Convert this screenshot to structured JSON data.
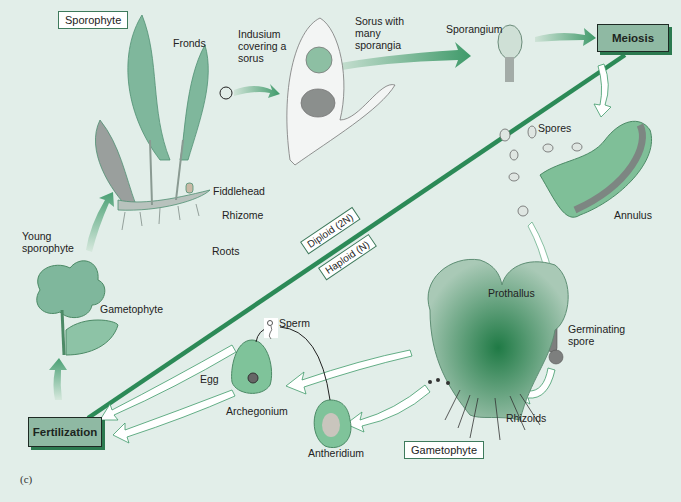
{
  "figure": {
    "panel_label": "(c)",
    "colors": {
      "background": "#e2eee9",
      "accent_green": "#2c8a57",
      "stage_box_fill": "#8fb9a3",
      "label_box_border": "#3e7a5c"
    }
  },
  "stages": {
    "sporophyte_box": "Sporophyte",
    "gametophyte_box": "Gametophyte",
    "meiosis": "Meiosis",
    "fertilization": "Fertilization"
  },
  "ploidy": {
    "diploid": "Diploid (2N)",
    "haploid": "Haploid (N)"
  },
  "labels": {
    "fronds": "Fronds",
    "indusium": [
      "Indusium",
      "covering a",
      "sorus"
    ],
    "sorus": [
      "Sorus with",
      "many",
      "sporangia"
    ],
    "sporangium": "Sporangium",
    "spores": "Spores",
    "annulus": "Annulus",
    "fiddlehead": "Fiddlehead",
    "rhizome": "Rhizome",
    "roots": "Roots",
    "young_sporophyte": [
      "Young",
      "sporophyte"
    ],
    "gametophyte_small": "Gametophyte",
    "prothallus": "Prothallus",
    "germinating_spore": [
      "Germinating",
      "spore"
    ],
    "sperm": "Sperm",
    "egg": "Egg",
    "archegonium": "Archegonium",
    "antheridium": "Antheridium",
    "rhizoids": "Rhizoids"
  }
}
